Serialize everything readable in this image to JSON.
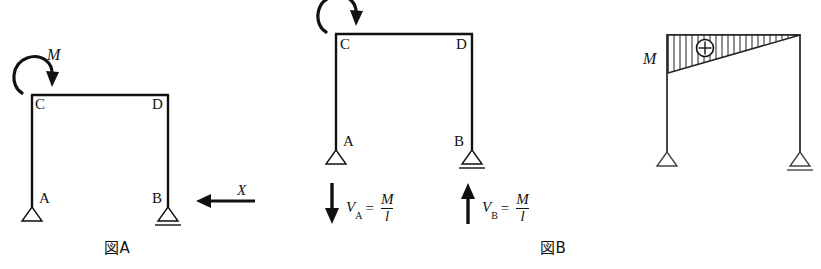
{
  "figure_a": {
    "caption": "図A",
    "joint_labels": {
      "A": "A",
      "B": "B",
      "C": "C",
      "D": "D"
    },
    "moment_label": "M",
    "force_label": "X",
    "supports": {
      "A": "pin-support",
      "B": "roller-support"
    },
    "moment_direction": "counterclockwise-at-C",
    "force_direction": "leftward-at-B"
  },
  "figure_b": {
    "caption": "図B",
    "joint_labels": {
      "A": "A",
      "B": "B",
      "C": "C",
      "D": "D"
    },
    "moment_label": "M",
    "supports": {
      "A": "pin-support",
      "B": "roller-support"
    },
    "reaction_a": {
      "symbol": "V",
      "subscript": "A",
      "equals": "=",
      "numerator": "M",
      "denominator": "l",
      "direction": "down"
    },
    "reaction_b": {
      "symbol": "V",
      "subscript": "B",
      "equals": "=",
      "numerator": "M",
      "denominator": "l",
      "direction": "up"
    }
  },
  "figure_c": {
    "moment_label": "M",
    "sign_symbol": "⊕",
    "diagram_type": "bending-moment-diagram",
    "supports": {
      "left": "pin-support",
      "right": "roller-support"
    },
    "hatch_count": 22
  },
  "colors": {
    "ink": "#1a1a1a",
    "line": "#111111",
    "background": "#ffffff"
  }
}
